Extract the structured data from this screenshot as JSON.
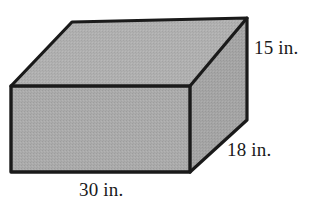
{
  "figure": {
    "kind": "rectangular-prism",
    "title": "",
    "colors": {
      "face_fill": "#a9a9a9",
      "top_fill": "#aeaeae",
      "side_fill": "#a2a2a2",
      "outline": "#1a1a1a",
      "background": "#ffffff",
      "label_color": "#1a1a1a"
    },
    "labels": {
      "height": "15 in.",
      "depth": "18 in.",
      "width": "30 in."
    },
    "geometry": {
      "front_face": "11,86 190,86 190,172 11,172",
      "top_face": "11,86 72,22 247,18 190,86",
      "right_face": "190,86 247,18 247,120 190,172",
      "edge_front_top": "11,86 190,86",
      "edge_front_bottom": "11,172 190,172",
      "edge_front_left": "11,86 11,172",
      "edge_front_right": "190,86 190,172",
      "edge_top_left": "11,86 72,22",
      "edge_top_back": "72,22 247,18",
      "edge_top_right": "190,86 247,18",
      "edge_back_right_vertical": "247,18 247,120",
      "edge_bottom_right": "190,172 247,120"
    }
  }
}
